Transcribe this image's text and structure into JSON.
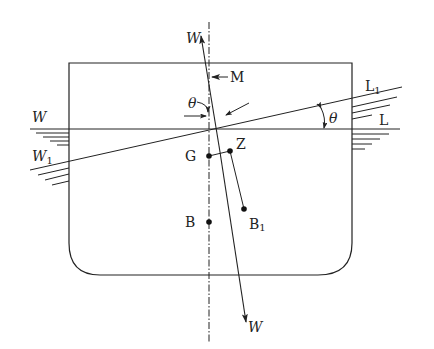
{
  "diagram": {
    "type": "ship-stability-heel",
    "colors": {
      "stroke": "#222222",
      "background": "#ffffff"
    },
    "labels": {
      "weight_top": "W",
      "weight_bottom": "W",
      "metacenter": "M",
      "theta_center": "θ",
      "theta_right": "θ",
      "waterline_left": "W",
      "waterline_right": "L",
      "inclined_left": "W",
      "inclined_left_sub": "1",
      "inclined_right": "L",
      "inclined_right_sub": "1",
      "gravity": "G",
      "z_point": "Z",
      "buoyancy": "B",
      "buoyancy_inclined": "B",
      "buoyancy_inclined_sub": "1"
    },
    "points": {
      "M": [
        209,
        77
      ],
      "G": [
        209,
        156
      ],
      "Z": [
        230,
        151
      ],
      "B": [
        209,
        222
      ],
      "B1": [
        244,
        209
      ]
    }
  }
}
